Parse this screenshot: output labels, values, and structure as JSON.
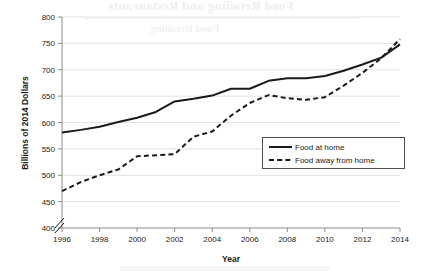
{
  "page": {
    "bleed_through_title": "Food Retailing and Restaurants",
    "bleed_through_subtitle": "Food Retailing"
  },
  "chart_data": {
    "type": "line",
    "title": "",
    "xlabel": "Year",
    "ylabel": "Billions of 2014 Dollars",
    "xlim": [
      1996,
      2014
    ],
    "ylim": [
      400,
      800
    ],
    "ytick_labels": [
      "400",
      "450",
      "500",
      "550",
      "600",
      "650",
      "700",
      "750",
      "800"
    ],
    "yticks": [
      400,
      450,
      500,
      550,
      600,
      650,
      700,
      750,
      800
    ],
    "xtick_labels": [
      "1996",
      "1998",
      "2000",
      "2002",
      "2004",
      "2006",
      "2008",
      "2010",
      "2012",
      "2014"
    ],
    "xticks": [
      1996,
      1998,
      2000,
      2002,
      2004,
      2006,
      2008,
      2010,
      2012,
      2014
    ],
    "grid": true,
    "y_axis_break": true,
    "legend_position": "center-right",
    "x": [
      1996,
      1997,
      1998,
      1999,
      2000,
      2001,
      2002,
      2003,
      2004,
      2005,
      2006,
      2007,
      2008,
      2009,
      2010,
      2011,
      2012,
      2013,
      2014
    ],
    "series": [
      {
        "name": "Food at home",
        "style": "solid",
        "color": "#1a1a1a",
        "values": [
          581,
          586,
          592,
          601,
          609,
          620,
          640,
          645,
          651,
          664,
          664,
          679,
          684,
          684,
          688,
          698,
          710,
          723,
          748
        ]
      },
      {
        "name": "Food away from home",
        "style": "dashed",
        "color": "#1a1a1a",
        "values": [
          470,
          487,
          500,
          511,
          536,
          538,
          540,
          573,
          583,
          613,
          637,
          652,
          646,
          643,
          648,
          670,
          694,
          722,
          758
        ]
      }
    ]
  },
  "legend": {
    "items": [
      {
        "label": "Food at home",
        "style": "solid"
      },
      {
        "label": "Food away from home",
        "style": "dashed"
      }
    ]
  }
}
